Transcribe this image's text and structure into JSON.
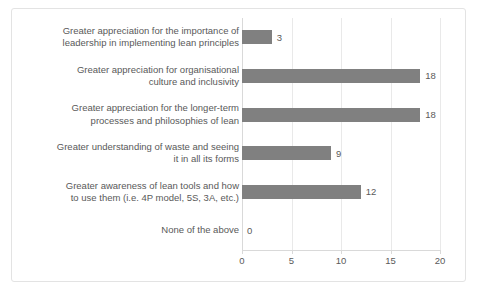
{
  "chart_data": {
    "type": "bar",
    "orientation": "horizontal",
    "title": "",
    "xlabel": "",
    "ylabel": "",
    "xlim": [
      0,
      20
    ],
    "xticks": [
      0,
      5,
      10,
      15,
      20
    ],
    "grid": true,
    "legend": false,
    "bar_color": "#808080",
    "label_color": "#595959",
    "categories": [
      "Greater appreciation for the importance of\nleadership in implementing lean principles",
      "Greater appreciation for organisational\nculture and inclusivity",
      "Greater appreciation for the longer-term\nprocesses and philosophies of lean",
      "Greater understanding of waste and seeing\nit in all its forms",
      "Greater awareness of lean tools and how\nto use them (i.e. 4P model, 5S, 3A, etc.)",
      "None of the above"
    ],
    "values": [
      3,
      18,
      18,
      9,
      12,
      0
    ],
    "value_labels": [
      "3",
      "18",
      "18",
      "9",
      "12",
      "0"
    ],
    "tick_labels": [
      "0",
      "5",
      "10",
      "15",
      "20"
    ]
  }
}
